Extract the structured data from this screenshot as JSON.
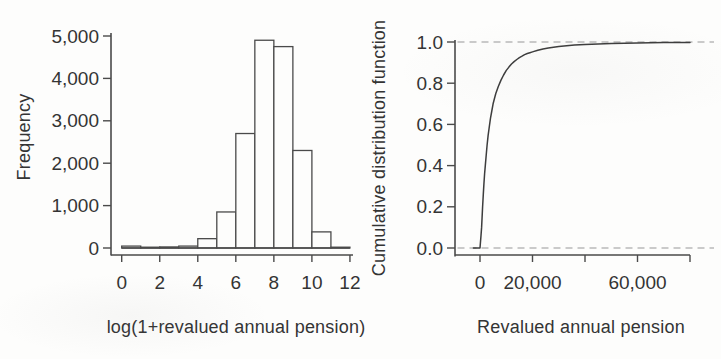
{
  "figure": {
    "background": "#fdfdfc",
    "colors": {
      "axis": "#4a4a4a",
      "text": "#343434",
      "bar_outline": "#4a4a4a",
      "bar_fill": "#fdfdfc",
      "curve": "#3d3d3d",
      "dashed_reference": "#b9b9b9"
    }
  },
  "chart_data": [
    {
      "type": "bar",
      "subtype": "histogram",
      "title": "",
      "xlabel": "log(1+revalued annual pension)",
      "ylabel": "Frequency",
      "bin_start": 0,
      "bin_width": 1,
      "categories": [
        "0-1",
        "1-2",
        "2-3",
        "3-4",
        "4-5",
        "5-6",
        "6-7",
        "7-8",
        "8-9",
        "9-10",
        "10-11",
        "11-12"
      ],
      "values": [
        45,
        10,
        25,
        45,
        220,
        850,
        2700,
        4900,
        4750,
        2300,
        380,
        10
      ],
      "x_ticks": [
        0,
        2,
        4,
        6,
        8,
        10,
        12
      ],
      "x_tick_labels": [
        "0",
        "2",
        "4",
        "6",
        "8",
        "10",
        "12"
      ],
      "y_ticks": [
        0,
        1000,
        2000,
        3000,
        4000,
        5000
      ],
      "y_tick_labels": [
        "0",
        "1,000",
        "2,000",
        "3,000",
        "4,000",
        "5,000"
      ],
      "xlim": [
        -0.6,
        12.2
      ],
      "ylim": [
        0,
        5000
      ],
      "grid": false,
      "legend": null
    },
    {
      "type": "line",
      "subtype": "empirical-cdf",
      "title": "",
      "xlabel": "Revalued annual pension",
      "ylabel": "Cumulative distribution function",
      "x_ticks": [
        0,
        20000,
        40000,
        60000,
        80000
      ],
      "x_tick_labels": [
        "0",
        "20,000",
        "",
        "60,000",
        ""
      ],
      "y_ticks": [
        0,
        0.2,
        0.4,
        0.6,
        0.8,
        1.0
      ],
      "y_tick_labels": [
        "0.0",
        "0.2",
        "0.4",
        "0.6",
        "0.8",
        "1.0"
      ],
      "reference_lines_y": [
        0,
        1.0
      ],
      "reference_line_style": "dashed",
      "xlim": [
        -2500,
        84000
      ],
      "ylim": [
        0,
        1
      ],
      "grid": false,
      "legend": null,
      "points": [
        [
          -2500,
          0
        ],
        [
          0,
          0
        ],
        [
          200,
          0.03
        ],
        [
          400,
          0.06
        ],
        [
          600,
          0.1
        ],
        [
          800,
          0.15
        ],
        [
          1000,
          0.2
        ],
        [
          1250,
          0.26
        ],
        [
          1500,
          0.31
        ],
        [
          1750,
          0.36
        ],
        [
          2000,
          0.4
        ],
        [
          2350,
          0.45
        ],
        [
          2700,
          0.5
        ],
        [
          3100,
          0.545
        ],
        [
          3500,
          0.585
        ],
        [
          4000,
          0.63
        ],
        [
          4500,
          0.665
        ],
        [
          5000,
          0.7
        ],
        [
          5500,
          0.725
        ],
        [
          6000,
          0.75
        ],
        [
          7000,
          0.785
        ],
        [
          8000,
          0.815
        ],
        [
          9000,
          0.84
        ],
        [
          10000,
          0.862
        ],
        [
          11000,
          0.878
        ],
        [
          12000,
          0.893
        ],
        [
          13000,
          0.905
        ],
        [
          14000,
          0.915
        ],
        [
          15000,
          0.924
        ],
        [
          16000,
          0.931
        ],
        [
          17000,
          0.939
        ],
        [
          18000,
          0.944
        ],
        [
          19000,
          0.948
        ],
        [
          20000,
          0.952
        ],
        [
          22000,
          0.96
        ],
        [
          24000,
          0.966
        ],
        [
          26000,
          0.971
        ],
        [
          28000,
          0.975
        ],
        [
          30000,
          0.978
        ],
        [
          33000,
          0.982
        ],
        [
          36000,
          0.985
        ],
        [
          40000,
          0.988
        ],
        [
          45000,
          0.991
        ],
        [
          50000,
          0.993
        ],
        [
          55000,
          0.994
        ],
        [
          60000,
          0.995
        ],
        [
          65000,
          0.996
        ],
        [
          70000,
          0.997
        ],
        [
          75000,
          0.9975
        ],
        [
          80000,
          0.998
        ]
      ]
    }
  ]
}
